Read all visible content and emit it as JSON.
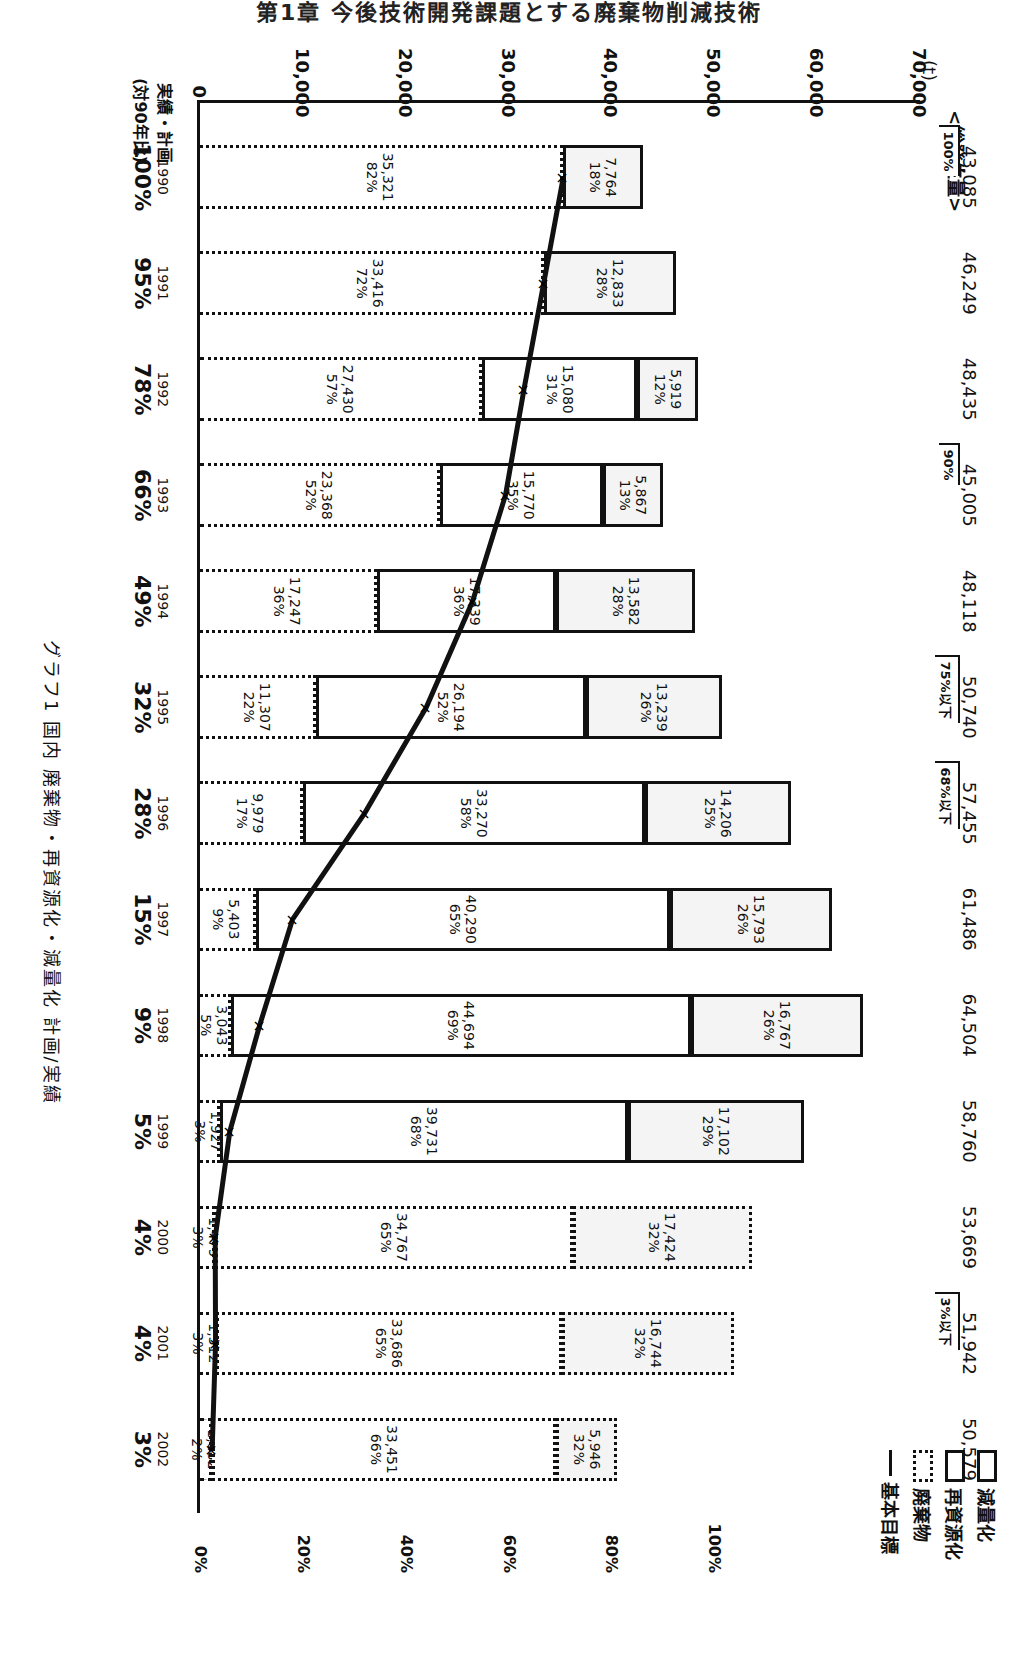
{
  "page_header": "第1章 今後技術開発課題とする廃棄物削減技術",
  "chart_data": {
    "type": "bar",
    "orientation": "rotated-90",
    "title": "グラフ1 国内 廃棄物・再資源化・減量化 計画/実績",
    "ylabel": "(t)",
    "ylim": [
      0,
      70000
    ],
    "y_ticks": [
      "0",
      "10,000",
      "20,000",
      "30,000",
      "40,000",
      "50,000",
      "60,000",
      "70,000"
    ],
    "secondary_axis_ticks": [
      "0%",
      "20%",
      "40%",
      "60%",
      "80%",
      "100%"
    ],
    "x_axis_unit": "(年)",
    "row_label_top": "実績・計画",
    "row_label_bottom": "(対90年比)",
    "total_label": "<総発生量>",
    "categories": [
      "1990",
      "1991",
      "1992",
      "1993",
      "1994",
      "1995",
      "1996",
      "1997",
      "1998",
      "1999",
      "2000",
      "2001",
      "2002"
    ],
    "status": [
      "実績",
      "実績",
      "実績",
      "実績",
      "実績",
      "実績",
      "実績",
      "実績",
      "実績",
      "実績",
      "計画",
      "計画",
      "計画"
    ],
    "totals": [
      "43,085",
      "46,249",
      "48,435",
      "45,005",
      "48,118",
      "50,740",
      "57,455",
      "61,486",
      "64,504",
      "58,760",
      "53,669",
      "51,942",
      "50,579"
    ],
    "ratio_vs_1990": [
      "100%",
      "95%",
      "78%",
      "66%",
      "49%",
      "32%",
      "28%",
      "15%",
      "9%",
      "5%",
      "4%",
      "4%",
      "3%"
    ],
    "series": [
      {
        "name": "廃棄物",
        "style": "dotted",
        "values": [
          35321,
          33416,
          27430,
          23368,
          17247,
          11307,
          9979,
          5403,
          3043,
          1927,
          1479,
          1512,
          1182
        ],
        "labels": [
          "35,321",
          "33,416",
          "27,430",
          "23,368",
          "17,247",
          "11,307",
          "9,979",
          "5,403",
          "3,043",
          "1,927",
          "1,479",
          "1,512",
          "1,182"
        ],
        "pct": [
          "82%",
          "72%",
          "57%",
          "52%",
          "36%",
          "22%",
          "17%",
          "9%",
          "5%",
          "3%",
          "3%",
          "3%",
          "2%"
        ]
      },
      {
        "name": "再資源化",
        "style": "solid",
        "values": [
          0,
          0,
          15080,
          15770,
          17339,
          26194,
          33270,
          40290,
          44694,
          39731,
          34767,
          33686,
          33451
        ],
        "labels": [
          "",
          "",
          "15,080",
          "15,770",
          "17,339",
          "26,194",
          "33,270",
          "40,290",
          "44,694",
          "39,731",
          "34,767",
          "33,686",
          "33,451"
        ],
        "pct": [
          "",
          "",
          "31%",
          "35%",
          "36%",
          "52%",
          "58%",
          "65%",
          "69%",
          "68%",
          "65%",
          "65%",
          "66%"
        ]
      },
      {
        "name": "減量化",
        "style": "solid-shaded",
        "values": [
          7764,
          12833,
          5919,
          5867,
          13582,
          13239,
          14206,
          15793,
          16767,
          17102,
          17424,
          16744,
          5946
        ],
        "labels": [
          "7,764",
          "12,833",
          "5,919",
          "5,867",
          "13,582",
          "13,239",
          "14,206",
          "15,793",
          "16,767",
          "17,102",
          "17,424",
          "16,744",
          "5,946"
        ],
        "pct": [
          "18%",
          "28%",
          "12%",
          "13%",
          "28%",
          "26%",
          "25%",
          "26%",
          "26%",
          "29%",
          "32%",
          "32%",
          "32%"
        ]
      },
      {
        "name": "基本目標",
        "type": "line",
        "values": [
          35321,
          33416,
          31500,
          29700,
          26500,
          22000,
          16000,
          9000,
          5800,
          2900,
          1479,
          1512,
          1182
        ]
      }
    ],
    "annotations": [
      {
        "text": "100%",
        "year": "1990"
      },
      {
        "text": "90%",
        "year": "1993"
      },
      {
        "text": "75%以下",
        "year": "1995"
      },
      {
        "text": "68%以下",
        "year": "1996"
      },
      {
        "text": "3%以下",
        "year": "2001"
      }
    ],
    "legend": [
      "減量化",
      "再資源化",
      "廃棄物",
      "基本目標"
    ],
    "legend_position": "top-right",
    "grid": false
  }
}
